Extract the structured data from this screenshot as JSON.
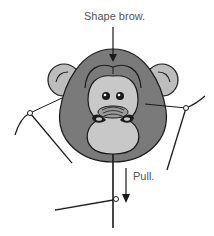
{
  "labels": {
    "shape_brow": "Shape brow.",
    "pull": "Pull."
  },
  "colors": {
    "face_dark": "#7a7a7a",
    "face_light": "#c8c8c8",
    "ear": "#bdbdbd",
    "outline": "#1a1a1a"
  },
  "icons": {
    "arrow_down": "down-arrow-icon",
    "needle": "needle-icon"
  }
}
